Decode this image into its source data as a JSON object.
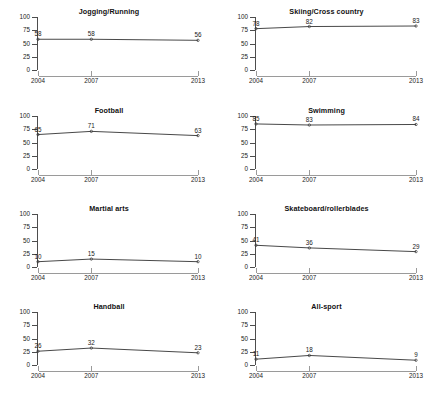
{
  "chart_data": {
    "type": "line",
    "title": "",
    "layout": {
      "rows": 4,
      "cols": 2,
      "grid": false,
      "legend": "none"
    },
    "x": [
      2004,
      2007,
      2013
    ],
    "xlabel": "",
    "ylabel": "",
    "ylim": [
      0,
      100
    ],
    "yticks": [
      0,
      25,
      50,
      75,
      100
    ],
    "xticks": [
      "2004",
      "2007",
      "2013"
    ],
    "panels": [
      {
        "title": "Jogging/Running",
        "values": [
          58,
          58,
          56
        ],
        "labels": [
          "58",
          "58",
          "56"
        ]
      },
      {
        "title": "Skiing/Cross country",
        "values": [
          78,
          82,
          83
        ],
        "labels": [
          "78",
          "82",
          "83"
        ]
      },
      {
        "title": "Football",
        "values": [
          65,
          71,
          63
        ],
        "labels": [
          "65",
          "71",
          "63"
        ]
      },
      {
        "title": "Swimming",
        "values": [
          85,
          83,
          84
        ],
        "labels": [
          "85",
          "83",
          "84"
        ]
      },
      {
        "title": "Martial arts",
        "values": [
          10,
          15,
          10
        ],
        "labels": [
          "10",
          "15",
          "10"
        ]
      },
      {
        "title": "Skateboard/rollerblades",
        "values": [
          41,
          36,
          29
        ],
        "labels": [
          "41",
          "36",
          "29"
        ]
      },
      {
        "title": "Handball",
        "values": [
          26,
          32,
          23
        ],
        "labels": [
          "26",
          "32",
          "23"
        ]
      },
      {
        "title": "All-sport",
        "values": [
          11,
          18,
          9
        ],
        "labels": [
          "11",
          "18",
          "9"
        ]
      }
    ]
  },
  "colors": {
    "line": "#333333",
    "marker": "#333333",
    "yaxis": "#4d4d4d",
    "xaxis": "#9a9a9a",
    "text": "#1a1a1a",
    "background": "#ffffff"
  }
}
